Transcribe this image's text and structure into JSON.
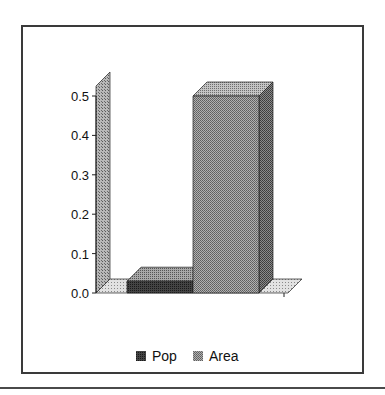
{
  "chart_data": {
    "type": "bar",
    "style": "3d-column",
    "title": "",
    "xlabel": "",
    "ylabel": "",
    "categories": [
      ""
    ],
    "series": [
      {
        "name": "Pop",
        "values": [
          0.03
        ],
        "color": "#333333",
        "pattern": "dark-dither"
      },
      {
        "name": "Area",
        "values": [
          0.5
        ],
        "color": "#8c8c8c",
        "pattern": "medium-dither"
      }
    ],
    "ylim": [
      0.0,
      0.5
    ],
    "yticks": [
      "0.0",
      "0.1",
      "0.2",
      "0.3",
      "0.4",
      "0.5"
    ],
    "grid": false,
    "legend": {
      "position": "bottom",
      "entries": [
        "Pop",
        "Area"
      ]
    }
  },
  "legend": {
    "items": [
      {
        "label": "Pop"
      },
      {
        "label": "Area"
      }
    ]
  }
}
